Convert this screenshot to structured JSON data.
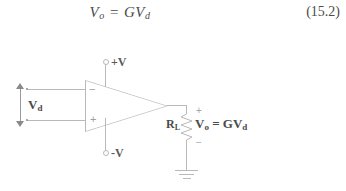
{
  "equation": {
    "lhs": "V",
    "lhs_sub": "o",
    "relation": " = G",
    "rhs": "V",
    "rhs_sub": "d",
    "number": "(15.2)"
  },
  "circuit": {
    "title": "op-amp amplifier with load resistor",
    "supply_positive": "+V",
    "supply_negative": "-V",
    "input_inverting_sign": "−",
    "input_noninverting_sign": "+",
    "differential_input_label": "V",
    "differential_input_sub": "d",
    "load_resistor_label": "R",
    "load_resistor_sub": "L",
    "output_label": "V",
    "output_sub": "o",
    "output_relation": " = GV",
    "output_relation_sub": "d",
    "polarity_plus": "+",
    "polarity_minus": "−",
    "line_color": "#b9b9b9",
    "text_color": "#4a4a4a"
  }
}
